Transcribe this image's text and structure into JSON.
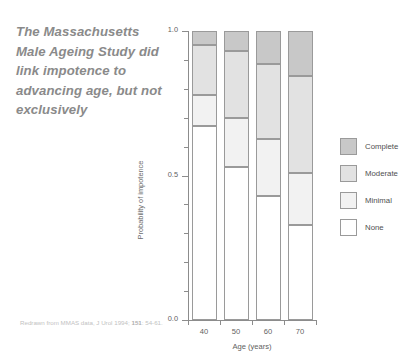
{
  "quote": {
    "text": "The Massachusetts Male Ageing Study did link impotence to advancing age, but not exclusively"
  },
  "caption": {
    "line1": "Redrawn from MMAS data, J Urol 1994;",
    "volume": "151",
    "line2": ": 54-61."
  },
  "colors": {
    "complete": "#c8c8c8",
    "moderate": "#e2e2e2",
    "minimal": "#f2f2f2",
    "none": "#ffffff",
    "outline": "#9a9a9a",
    "axis": "#8c8c8c",
    "quote_text": "#8a8a8a"
  },
  "chart_data": {
    "type": "bar",
    "subtype": "stacked",
    "title": "",
    "xlabel": "Age (years)",
    "ylabel": "Probability of impotence",
    "categories": [
      "40",
      "50",
      "60",
      "70"
    ],
    "x": [
      40,
      50,
      60,
      70
    ],
    "ylim": [
      0.0,
      1.0
    ],
    "ytick_labels": [
      "0.0",
      "0.5",
      "1.0"
    ],
    "ytick_values": [
      0.0,
      0.5,
      1.0
    ],
    "yminor_step": 0.1,
    "grid": false,
    "legend_position": "right",
    "series": [
      {
        "name": "None",
        "values": [
          0.67,
          0.53,
          0.43,
          0.33
        ]
      },
      {
        "name": "Minimal",
        "values": [
          0.11,
          0.17,
          0.195,
          0.18
        ]
      },
      {
        "name": "Moderate",
        "values": [
          0.17,
          0.23,
          0.26,
          0.335
        ]
      },
      {
        "name": "Complete",
        "values": [
          0.05,
          0.07,
          0.115,
          0.155
        ]
      }
    ],
    "legend": [
      {
        "label": "Complete",
        "color": "#c8c8c8"
      },
      {
        "label": "Moderate",
        "color": "#e2e2e2"
      },
      {
        "label": "Minimal",
        "color": "#f2f2f2"
      },
      {
        "label": "None",
        "color": "#ffffff"
      }
    ]
  }
}
